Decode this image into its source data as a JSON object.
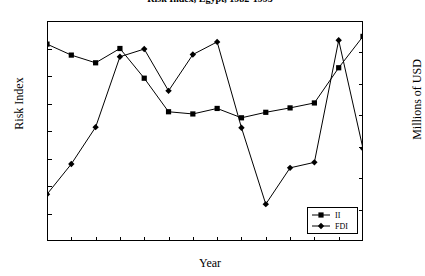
{
  "chart_data": {
    "type": "line",
    "title": "Risk Index, Egypt, 1982-1995",
    "xlabel": "Year",
    "ylabel": "Risk Index",
    "ylabel_right": "Millions of USD",
    "grid": false,
    "legend_position": "bottom-right",
    "categories": [
      "1982",
      "1983",
      "1984",
      "1985",
      "1986",
      "1987",
      "1988",
      "1989",
      "1990",
      "1991",
      "1992",
      "1993",
      "1994",
      "1995"
    ],
    "x": [
      1982,
      1983,
      1984,
      1985,
      1986,
      1987,
      1988,
      1989,
      1990,
      1991,
      1992,
      1993,
      1994,
      1995
    ],
    "ylim": [
      0,
      40
    ],
    "yticks": [
      0,
      5,
      10,
      15,
      20,
      25,
      30,
      35,
      40
    ],
    "ylim_right": [
      0,
      1400
    ],
    "yticks_right": [
      0,
      200,
      400,
      600,
      800,
      1000,
      1200,
      1400
    ],
    "series": [
      {
        "name": "II",
        "axis": "left",
        "marker": "square",
        "values": [
          35.8,
          33.8,
          32.4,
          35.0,
          29.6,
          23.5,
          23.1,
          24.1,
          22.4,
          23.4,
          24.2,
          25.1,
          31.5,
          37.2
        ]
      },
      {
        "name": "FDI",
        "axis": "left",
        "marker": "diamond",
        "values": [
          8.5,
          14.0,
          20.7,
          33.5,
          34.9,
          27.3,
          33.9,
          36.2,
          20.6,
          6.7,
          13.3,
          14.3,
          36.5,
          16.8
        ]
      }
    ],
    "legend": [
      {
        "label": "II",
        "marker": "square"
      },
      {
        "label": "FDI",
        "marker": "diamond"
      }
    ]
  },
  "axes": {
    "left_title": "Risk Index",
    "right_title": "Millions of USD",
    "x_title": "Year"
  }
}
